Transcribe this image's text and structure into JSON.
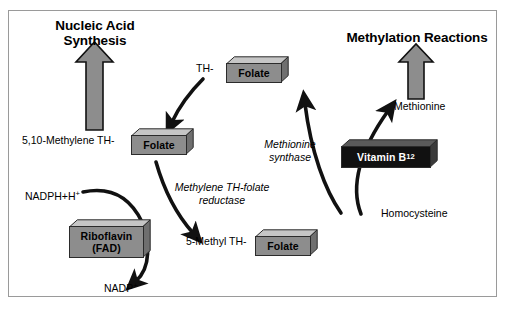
{
  "diagram": {
    "background_color": "#ffffff",
    "frame_color": "#9a9a9a",
    "box_gray_color": "#8d8d8d",
    "box_dark_color": "#111111",
    "arrow_color": "#111111",
    "block_arrow_fill": "#8d8d8d",
    "block_arrow_stroke": "#111111"
  },
  "headings": {
    "left": "Nucleic Acid\nSynthesis",
    "left_line1": "Nucleic Acid",
    "left_line2": "Synthesis",
    "right": "Methylation Reactions"
  },
  "boxes": [
    {
      "id": "folate-top",
      "label": "Folate",
      "style": "gray"
    },
    {
      "id": "folate-left",
      "label": "Folate",
      "style": "gray"
    },
    {
      "id": "folate-bottom",
      "label": "Folate",
      "style": "gray"
    },
    {
      "id": "riboflavin",
      "label": "Riboflavin",
      "label2": "(FAD)",
      "style": "gray"
    },
    {
      "id": "vitamin-b12",
      "label": "Vitamin B",
      "subscript": "12",
      "style": "dark"
    }
  ],
  "labels": {
    "th_prefix": "TH-",
    "methylene_prefix": "5,10-Methylene TH-",
    "methyl_prefix": "5-Methyl TH-",
    "nadph": "NADPH+H",
    "nadph_sup": "+",
    "nadp": "NADP",
    "nadp_sup": "+",
    "methionine": "Methionine",
    "homocysteine": "Homocysteine"
  },
  "enzymes": {
    "reductase_line1": "Methylene TH-folate",
    "reductase_line2": "reductase",
    "synthase_line1": "Methionine",
    "synthase_line2": "synthase"
  },
  "arrows": [
    {
      "id": "block-arrow-nucleic-acid",
      "kind": "block",
      "direction": "up"
    },
    {
      "id": "block-arrow-methylation",
      "kind": "block",
      "direction": "up"
    },
    {
      "id": "curve-th-folate-to-methylene",
      "kind": "curved"
    },
    {
      "id": "curve-methylene-to-methyl",
      "kind": "curved"
    },
    {
      "id": "curve-nadph-in",
      "kind": "curved"
    },
    {
      "id": "curve-nadp-out",
      "kind": "curved"
    },
    {
      "id": "curve-methyl-to-th-folate",
      "kind": "curved"
    },
    {
      "id": "curve-homocysteine-to-methionine",
      "kind": "curved"
    }
  ]
}
